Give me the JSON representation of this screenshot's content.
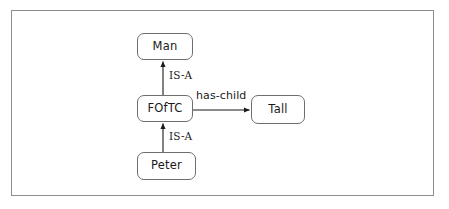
{
  "diagram": {
    "frame": {
      "border_color": "#8d8d8d"
    },
    "node_border_color": "#6e6e6e",
    "node_fill_color": "#ffffff",
    "edge_color": "#1a1a1a",
    "text_color": "#1a1a1a",
    "nodes": [
      {
        "id": "man",
        "label": "Man"
      },
      {
        "id": "foftc",
        "label": "FOfTC"
      },
      {
        "id": "tall",
        "label": "Tall"
      },
      {
        "id": "peter",
        "label": "Peter"
      }
    ],
    "edges": [
      {
        "id": "foftc-man",
        "from": "FOfTC",
        "to": "Man",
        "label": "IS-A",
        "direction": "up"
      },
      {
        "id": "peter-foftc",
        "from": "Peter",
        "to": "FOfTC",
        "label": "IS-A",
        "direction": "up"
      },
      {
        "id": "foftc-tall",
        "from": "FOfTC",
        "to": "Tall",
        "label": "has-child",
        "direction": "right"
      }
    ]
  }
}
